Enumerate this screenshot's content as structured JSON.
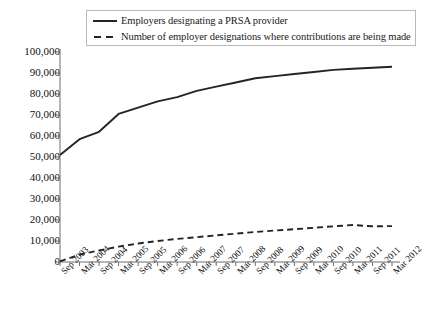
{
  "chart_data": {
    "type": "line",
    "title": "",
    "xlabel": "",
    "ylabel": "",
    "ylim": [
      0,
      100000
    ],
    "ytick_labels": [
      "100,000",
      "90,000",
      "80,000",
      "70,000",
      "60,000",
      "50,000",
      "40,000",
      "30,000",
      "20,000",
      "10,000",
      "0"
    ],
    "ytick_values": [
      100000,
      90000,
      80000,
      70000,
      60000,
      50000,
      40000,
      30000,
      20000,
      10000,
      0
    ],
    "grid": false,
    "legend_position": "top",
    "categories": [
      "Sep 2003",
      "Mar 2004",
      "Sep 2004",
      "Mar 2005",
      "Sep 2005",
      "Mar 2006",
      "Sep 2006",
      "Mar 2007",
      "Sep 2007",
      "Mar 2008",
      "Sep 2008",
      "Mar 2009",
      "Sep 2009",
      "Mar 2010",
      "Sep 2010",
      "Mar 2011",
      "Sep 2011",
      "Mar 2012"
    ],
    "series": [
      {
        "name": "Employers designating a PRSA provider",
        "style": "solid",
        "color": "#242424",
        "values": [
          51000,
          58500,
          62000,
          70500,
          73500,
          76500,
          78500,
          81500,
          83500,
          85500,
          87500,
          88500,
          89500,
          90500,
          91500,
          92000,
          92500,
          93000
        ]
      },
      {
        "name": "Number of employer designations where contributions are being made",
        "style": "dashed",
        "color": "#242424",
        "values": [
          300,
          3500,
          5500,
          7300,
          8800,
          10000,
          11000,
          11800,
          12700,
          13500,
          14300,
          15000,
          15600,
          16300,
          17000,
          17600,
          17000,
          17100
        ]
      }
    ]
  },
  "legend": {
    "items": [
      {
        "label": "Employers designating a PRSA provider",
        "style": "solid"
      },
      {
        "label": "Number of employer designations where contributions are being made",
        "style": "dashed"
      }
    ]
  }
}
